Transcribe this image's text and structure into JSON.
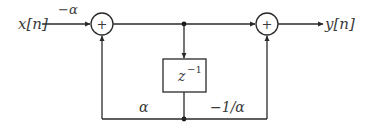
{
  "diagram": {
    "input_label": "x[n]",
    "output_label": "y[n]",
    "input_gain": "−α",
    "adder_symbol": "+",
    "delay": {
      "base": "z",
      "exponent": "−1"
    },
    "feedback_gain": "α",
    "feedforward_gain": "−1/α",
    "colors": {
      "line": "#2a2a2a",
      "text": "#3a3a3a",
      "background": "#ffffff"
    }
  }
}
